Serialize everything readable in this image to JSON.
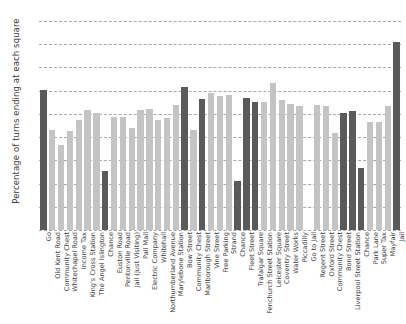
{
  "chart_data": {
    "type": "bar",
    "title": "",
    "xlabel": "",
    "ylabel": "Percentage of turns ending at each square",
    "ylim": [
      0,
      4.5
    ],
    "grid": true,
    "legend": null,
    "y_ticks": [
      "4.5%",
      "4.0%",
      "3.5%",
      "3.0%",
      "2.5%",
      "2.0%",
      "1.5%",
      "1.0%",
      "0.5%",
      "0%"
    ],
    "y_tick_values": [
      4.5,
      4.0,
      3.5,
      3.0,
      2.5,
      2.0,
      1.5,
      1.0,
      0.5,
      0
    ],
    "categories": [
      "Go",
      "Old Kent Road",
      "Community Chest",
      "Whitechapel Road",
      "Income Tax",
      "King's Cross Station",
      "The Angel Islington",
      "Chance",
      "Euston Road",
      "Pentonville Road",
      "Jail (Just Visiting)",
      "Pall Mall",
      "Electric Company",
      "Whitehall",
      "Northumberland Avenue",
      "Marylebone Station",
      "Bow Street",
      "Community Chest",
      "Marlborough Street",
      "Vine Street",
      "Free Parking",
      "Strand",
      "Chance",
      "Fleet Street",
      "Trafalgar Square",
      "Fenchurch Street Station",
      "Leicester Square",
      "Coventry Street",
      "Water Works",
      "Piccadilly",
      "Go to Jail",
      "Regent Street",
      "Oxford Street",
      "Community Chest",
      "Bond Street",
      "Liverpool Street Station",
      "Chance",
      "Park Lane",
      "Super Tax",
      "Mayfair",
      "Jail"
    ],
    "values": [
      3.02,
      2.15,
      1.82,
      2.14,
      2.36,
      2.58,
      2.52,
      1.26,
      2.44,
      2.43,
      2.2,
      2.58,
      2.6,
      2.37,
      2.41,
      2.7,
      3.08,
      2.15,
      2.82,
      2.96,
      2.88,
      2.91,
      1.06,
      2.84,
      2.75,
      2.75,
      3.17,
      2.79,
      2.72,
      2.68,
      0.0,
      2.7,
      2.67,
      2.09,
      2.51,
      2.56,
      1.33,
      2.32,
      2.33,
      2.68,
      4.05
    ],
    "bar_shades": [
      "dark",
      "light",
      "light",
      "light",
      "light",
      "light",
      "light",
      "dark",
      "light",
      "light",
      "light",
      "light",
      "light",
      "light",
      "light",
      "light",
      "dark",
      "light",
      "dark",
      "light",
      "light",
      "light",
      "dark",
      "dark",
      "dark",
      "light",
      "light",
      "light",
      "light",
      "light",
      "dark",
      "light",
      "light",
      "light",
      "dark",
      "dark",
      "dark",
      "light",
      "light",
      "light",
      "dark"
    ],
    "colors": {
      "bar_dark": "#5a5a5a",
      "bar_light": "#c4c4c4",
      "gridline": "#a8a8a8",
      "text": "#3b3b3b",
      "background": "#ffffff"
    }
  }
}
